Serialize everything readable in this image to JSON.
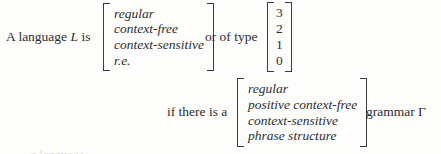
{
  "figure": {
    "caption_type": "formal-language-hierarchy-statement",
    "lead_text": "A language",
    "lead_symbol": "L",
    "lead_verb": "is",
    "mid_text": "or of type",
    "condition_text": "if there is a",
    "tail_text": "grammar",
    "tail_symbol": "Γ",
    "scan_remnant": "a language"
  },
  "language_classes": {
    "items": [
      "regular",
      "context-free",
      "context-sensitive",
      "r.e."
    ]
  },
  "chomsky_types": {
    "items": [
      "3",
      "2",
      "1",
      "0"
    ]
  },
  "grammar_classes": {
    "items": [
      "regular",
      "positive context-free",
      "context-sensitive",
      "phrase structure"
    ]
  },
  "colors": {
    "ink": "#2e2e2e",
    "bracket": "#3a3a3a",
    "page": "#fdfdfc"
  }
}
